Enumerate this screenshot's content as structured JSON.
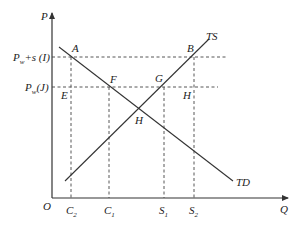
{
  "diagram": {
    "axes": {
      "y_label": "P",
      "x_label": "Q",
      "origin_label": "O"
    },
    "price_levels": [
      {
        "label_main": "P",
        "label_sub": "w",
        "label_rest": "+s (I)"
      },
      {
        "label_main": "P",
        "label_sub": "w",
        "label_rest": "(J)"
      }
    ],
    "curves": [
      {
        "label": "TS",
        "type": "supply"
      },
      {
        "label": "TD",
        "type": "demand"
      }
    ],
    "points": {
      "A": "A",
      "B": "B",
      "E": "E",
      "F": "F",
      "G": "G",
      "H_upper": "H",
      "H_lower": "H"
    },
    "x_ticks": [
      {
        "main": "C",
        "sub": "2"
      },
      {
        "main": "C",
        "sub": "1"
      },
      {
        "main": "S",
        "sub": "1"
      },
      {
        "main": "S",
        "sub": "2"
      }
    ]
  }
}
